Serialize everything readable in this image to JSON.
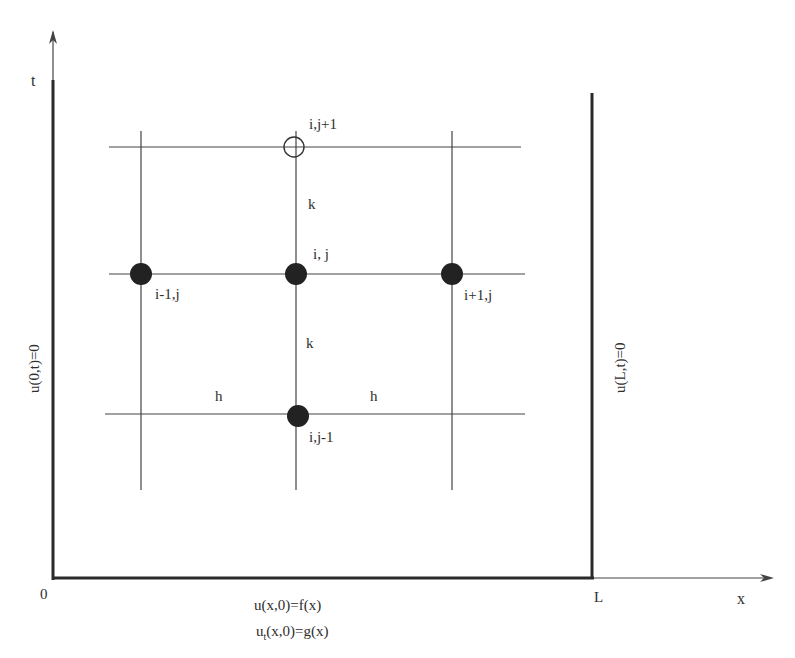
{
  "diagram": {
    "axes": {
      "t_label": "t",
      "x_label": "x",
      "origin_label": "0",
      "L_label": "L"
    },
    "boundary_conditions": {
      "left": "u(0,t)=0",
      "right": "u(L,t)=0"
    },
    "initial_conditions": {
      "displacement": "u(x,0)=f(x)",
      "velocity_base": "u",
      "velocity_sub": "t",
      "velocity_rest": "(x,0)=g(x)"
    },
    "nodes": {
      "top": "i,j+1",
      "center": "i, j",
      "left": "i-1,j",
      "right": "i+1,j",
      "bottom": "i,j-1"
    },
    "spacing": {
      "k_upper": "k",
      "k_lower": "k",
      "h_left": "h",
      "h_right": "h"
    },
    "colors": {
      "line": "#333333",
      "node_fill": "#222222",
      "background": "#ffffff"
    }
  }
}
